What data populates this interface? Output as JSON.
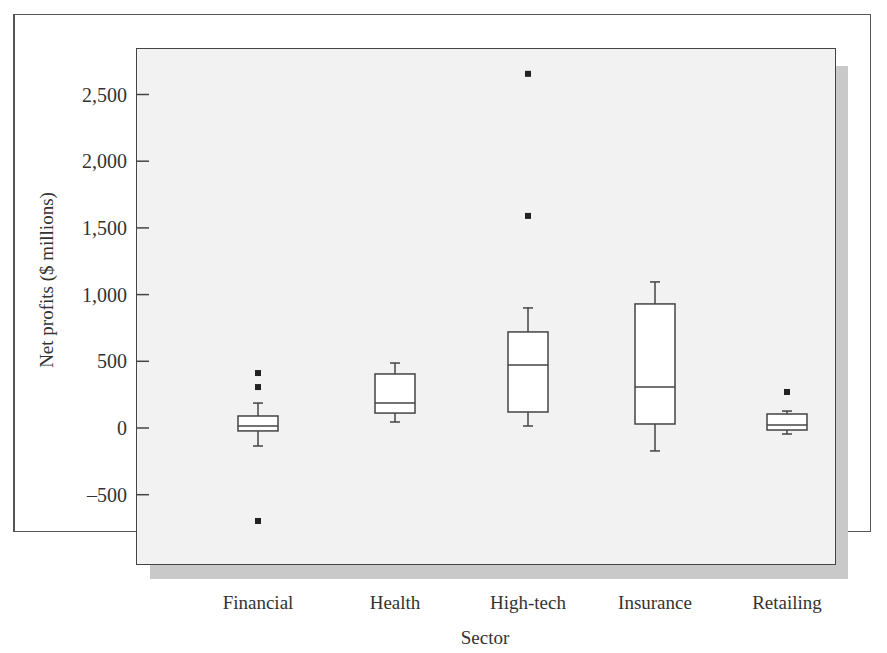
{
  "chart_data": {
    "type": "box",
    "title": "",
    "xlabel": "Sector",
    "ylabel": "Net profits ($ millions)",
    "ylim": [
      -750,
      2750
    ],
    "yticks": [
      2500,
      2000,
      1500,
      1000,
      500,
      0,
      -500
    ],
    "ytick_labels": [
      "2,500",
      "2,000",
      "1,500",
      "1,000",
      "500",
      "0",
      "–500"
    ],
    "grid": false,
    "legend": null,
    "categories": [
      "Financial",
      "Health",
      "High-tech",
      "Insurance",
      "Retailing"
    ],
    "boxes": [
      {
        "name": "Financial",
        "whisker_low": -135,
        "q1": -22,
        "median": 15,
        "q3": 90,
        "whisker_high": 187,
        "outliers": [
          412,
          307,
          -697
        ]
      },
      {
        "name": "Health",
        "whisker_low": 45,
        "q1": 112,
        "median": 187,
        "q3": 405,
        "whisker_high": 487,
        "outliers": []
      },
      {
        "name": "High-tech",
        "whisker_low": 15,
        "q1": 120,
        "median": 472,
        "q3": 720,
        "whisker_high": 900,
        "outliers": [
          2655,
          1590
        ]
      },
      {
        "name": "Insurance",
        "whisker_low": -172,
        "q1": 30,
        "median": 307,
        "q3": 930,
        "whisker_high": 1095,
        "outliers": []
      },
      {
        "name": "Retailing",
        "whisker_low": -45,
        "q1": -15,
        "median": 22,
        "q3": 105,
        "whisker_high": 127,
        "outliers": [
          270
        ]
      }
    ]
  },
  "colors": {
    "panel_bg": "#f2f2f2",
    "shadow": "#c9c9c9",
    "box_fill": "#ffffff",
    "stroke": "#444444",
    "outlier": "#222222"
  }
}
